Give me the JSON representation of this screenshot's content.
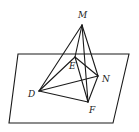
{
  "figure": {
    "plane": {
      "points": "18,54 129,54 113,123 9,123"
    },
    "points": {
      "M": {
        "x": 82,
        "y": 25,
        "label": "M",
        "lx": 78,
        "ly": 18
      },
      "E": {
        "x": 75,
        "y": 57,
        "label": "E",
        "lx": 69,
        "ly": 69
      },
      "N": {
        "x": 98,
        "y": 76,
        "label": "N",
        "lx": 102,
        "ly": 82
      },
      "D": {
        "x": 39,
        "y": 91,
        "label": "D",
        "lx": 28,
        "ly": 97
      },
      "F": {
        "x": 88,
        "y": 102,
        "label": "F",
        "lx": 89,
        "ly": 113
      }
    },
    "edges": [
      [
        "M",
        "D"
      ],
      [
        "M",
        "E"
      ],
      [
        "M",
        "N"
      ],
      [
        "M",
        "F"
      ],
      [
        "D",
        "E"
      ],
      [
        "D",
        "N"
      ],
      [
        "D",
        "F"
      ],
      [
        "E",
        "N"
      ],
      [
        "E",
        "F"
      ],
      [
        "N",
        "F"
      ]
    ],
    "labels": {
      "M": "M",
      "E": "E",
      "N": "N",
      "D": "D",
      "F": "F"
    }
  }
}
